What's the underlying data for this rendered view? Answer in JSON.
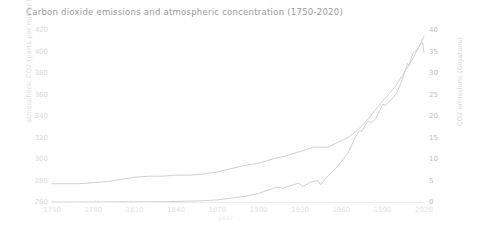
{
  "chart_data": {
    "type": "line",
    "title": "Carbon dioxide emissions and atmospheric concentration (1750-2020)",
    "xlabel": "year",
    "ylabel": "atmospheric CO2 (parts per million)",
    "ylabel_right": "CO2 emissions (Gigatons)",
    "xlim": [
      1750,
      2020
    ],
    "ylim": [
      260,
      420
    ],
    "ylim_right": [
      0,
      40
    ],
    "grid": false,
    "legend": "none",
    "x_ticks": [
      "1750",
      "1780",
      "1810",
      "1840",
      "1870",
      "1900",
      "1930",
      "1960",
      "1990",
      "2020"
    ],
    "y_ticks_left": [
      "420",
      "400",
      "380",
      "360",
      "340",
      "320",
      "300",
      "280",
      "260"
    ],
    "y_ticks_right": [
      "40",
      "35",
      "30",
      "25",
      "20",
      "15",
      "10",
      "5",
      "0"
    ],
    "line_color": "#d0d0d0",
    "series": [
      {
        "name": "atmospheric CO2 concentration",
        "axis": "left",
        "units": "parts per million",
        "x": [
          1750,
          1760,
          1770,
          1780,
          1790,
          1800,
          1810,
          1820,
          1830,
          1840,
          1850,
          1860,
          1870,
          1880,
          1890,
          1900,
          1910,
          1920,
          1930,
          1940,
          1950,
          1955,
          1960,
          1965,
          1970,
          1975,
          1980,
          1985,
          1990,
          1995,
          2000,
          2005,
          2010,
          2015,
          2020
        ],
        "values": [
          277,
          277,
          277,
          278,
          279,
          281,
          283,
          284,
          284,
          285,
          285,
          286,
          288,
          291,
          294,
          296,
          300,
          303,
          307,
          311,
          311,
          314,
          317,
          320,
          325,
          331,
          338,
          346,
          354,
          361,
          369,
          379,
          389,
          401,
          414
        ]
      },
      {
        "name": "CO2 emissions",
        "axis": "right",
        "units": "Gigatons",
        "x": [
          1750,
          1770,
          1790,
          1810,
          1830,
          1850,
          1860,
          1870,
          1880,
          1890,
          1900,
          1910,
          1913,
          1918,
          1920,
          1925,
          1929,
          1932,
          1937,
          1940,
          1943,
          1945,
          1948,
          1950,
          1955,
          1960,
          1965,
          1970,
          1973,
          1975,
          1979,
          1982,
          1985,
          1990,
          1992,
          1995,
          2000,
          2003,
          2008,
          2009,
          2012,
          2015,
          2018,
          2019,
          2020
        ],
        "values": [
          0.01,
          0.01,
          0.02,
          0.03,
          0.05,
          0.2,
          0.3,
          0.5,
          0.9,
          1.3,
          2.0,
          3.1,
          3.5,
          3.2,
          3.5,
          4.0,
          4.4,
          3.6,
          4.5,
          4.8,
          5.0,
          4.0,
          5.3,
          6.0,
          7.5,
          9.4,
          11.5,
          14.9,
          16.6,
          16.5,
          18.8,
          18.5,
          19.4,
          22.7,
          22.5,
          23.4,
          25.2,
          27.5,
          32.2,
          31.8,
          34.6,
          35.5,
          36.8,
          37.1,
          34.8
        ]
      }
    ]
  }
}
